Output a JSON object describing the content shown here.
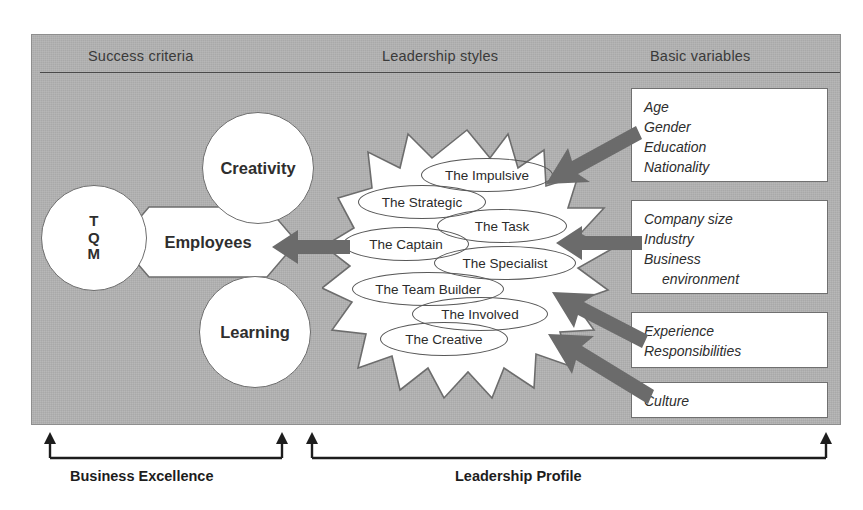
{
  "figure": {
    "background_color": "#b2b2b2",
    "panel_border_color": "#8e8e8e",
    "shape_fill": "#ffffff",
    "shape_stroke": "#6d6d6d",
    "arrow_color": "#6b6b6b",
    "text_color": "#2e2e2e"
  },
  "headers": [
    {
      "label": "Success criteria"
    },
    {
      "label": "Leadership styles"
    },
    {
      "label": "Basic variables"
    }
  ],
  "success_criteria": {
    "tqm": {
      "lines": [
        "T",
        "Q",
        "M"
      ]
    },
    "creativity": {
      "label": "Creativity"
    },
    "learning": {
      "label": "Learning"
    },
    "employees": {
      "label": "Employees"
    }
  },
  "leadership_styles": [
    {
      "label": "The Impulsive"
    },
    {
      "label": "The Strategic"
    },
    {
      "label": "The Task"
    },
    {
      "label": "The Captain"
    },
    {
      "label": "The Specialist"
    },
    {
      "label": "The Team Builder"
    },
    {
      "label": "The Involved"
    },
    {
      "label": "The Creative"
    }
  ],
  "basic_variables": [
    {
      "lines": [
        "Age",
        "Gender",
        "Education",
        "Nationality"
      ],
      "indent_from": null
    },
    {
      "lines": [
        "Company size",
        "Industry",
        "Business",
        "environment"
      ],
      "indent_from": 3
    },
    {
      "lines": [
        "Experience",
        "Responsibilities"
      ],
      "indent_from": null
    },
    {
      "lines": [
        "Culture"
      ],
      "indent_from": null
    }
  ],
  "brackets": [
    {
      "label": "Business Excellence"
    },
    {
      "label": "Leadership Profile"
    }
  ]
}
